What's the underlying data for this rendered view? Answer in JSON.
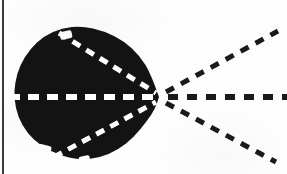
{
  "figure": {
    "caption": "",
    "media": "bitonal scan on off-white paper",
    "canvas": {
      "width": 287,
      "height": 174
    },
    "colors": {
      "paper": "#fdfdfd",
      "ink": "#111111",
      "blob_fill": "#131313",
      "dash_dark": "#1a1a1a",
      "dash_light": "#ffffff",
      "margin_rule": "#3a3a3a"
    }
  },
  "chart_data": {
    "type": "diagram",
    "title": "Dashed rays converging at a vertex on a filled blob",
    "xlabel": "",
    "ylabel": "",
    "xlim": [
      0,
      287
    ],
    "ylim": [
      0,
      174
    ],
    "grid": false,
    "legend": null,
    "vertex": {
      "label": "convergence point",
      "x": 159,
      "y": 97
    },
    "blob": {
      "label": "filled dark region",
      "fill": "#131313",
      "bounds": {
        "left": 13,
        "top": 25,
        "right": 159,
        "bottom": 161
      },
      "outline_points": [
        [
          159,
          97
        ],
        [
          151,
          74
        ],
        [
          140,
          56
        ],
        [
          124,
          41
        ],
        [
          104,
          31
        ],
        [
          82,
          26
        ],
        [
          62,
          28
        ],
        [
          44,
          36
        ],
        [
          30,
          49
        ],
        [
          20,
          65
        ],
        [
          15,
          82
        ],
        [
          14,
          99
        ],
        [
          18,
          117
        ],
        [
          27,
          133
        ],
        [
          41,
          146
        ],
        [
          59,
          155
        ],
        [
          79,
          160
        ],
        [
          99,
          158
        ],
        [
          118,
          150
        ],
        [
          134,
          137
        ],
        [
          147,
          121
        ],
        [
          155,
          109
        ]
      ],
      "notches": [
        {
          "x": 60,
          "y": 31,
          "w": 12,
          "h": 8
        },
        {
          "x": 38,
          "y": 145,
          "w": 13,
          "h": 9
        },
        {
          "x": 79,
          "y": 156,
          "w": 11,
          "h": 7
        }
      ]
    },
    "series": [
      {
        "name": "upper interior ray",
        "style": "dashed",
        "color": "#ffffff",
        "inside_blob": true,
        "from": [
          59,
          33
        ],
        "to": [
          156,
          93
        ],
        "dash_px": [
          9,
          7
        ],
        "width_px": 5
      },
      {
        "name": "horizontal interior ray",
        "style": "dashed",
        "color": "#ffffff",
        "inside_blob": true,
        "from": [
          9,
          97
        ],
        "to": [
          156,
          97
        ],
        "dash_px": [
          11,
          8
        ],
        "width_px": 6
      },
      {
        "name": "lower interior ray",
        "style": "dashed",
        "color": "#ffffff",
        "inside_blob": true,
        "from": [
          54,
          157
        ],
        "to": [
          156,
          102
        ],
        "dash_px": [
          9,
          7
        ],
        "width_px": 5
      },
      {
        "name": "upper exterior ray",
        "style": "dashed",
        "color": "#1a1a1a",
        "inside_blob": false,
        "from": [
          166,
          92
        ],
        "to": [
          278,
          31
        ],
        "dash_px": [
          9,
          8
        ],
        "width_px": 5
      },
      {
        "name": "horizontal exterior ray",
        "style": "dashed",
        "color": "#1a1a1a",
        "inside_blob": false,
        "from": [
          168,
          97
        ],
        "to": [
          287,
          97
        ],
        "dash_px": [
          10,
          9
        ],
        "width_px": 6
      },
      {
        "name": "lower exterior ray",
        "style": "dashed",
        "color": "#1a1a1a",
        "inside_blob": false,
        "from": [
          166,
          103
        ],
        "to": [
          276,
          162
        ],
        "dash_px": [
          9,
          8
        ],
        "width_px": 5
      }
    ],
    "annotations": [
      {
        "name": "left margin rule",
        "kind": "vertical-line",
        "x": 3,
        "y_from": 0,
        "y_to": 174,
        "color": "#3a3a3a",
        "width_px": 2
      }
    ]
  }
}
